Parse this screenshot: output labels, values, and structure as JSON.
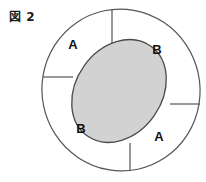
{
  "figure": {
    "caption": "図 2",
    "caption_prefix_glyph": "図",
    "caption_number": "2"
  },
  "colors": {
    "stroke": "#555555",
    "inner_fill": "#d2d2d2",
    "inner_stroke": "#4a4a4a",
    "background": "#ffffff",
    "label_color": "#111111"
  },
  "shapes": {
    "outer_ellipse": {
      "name": "outer-ring-ellipse",
      "cx": 121,
      "cy": 90,
      "rx": 79,
      "ry": 81,
      "rotation": -12,
      "fill": "none"
    },
    "inner_ellipse": {
      "name": "shaded-inner-ellipse",
      "cx": 119,
      "cy": 91,
      "rx": 43,
      "ry": 55,
      "rotation": 35,
      "fill": "#d2d2d2"
    }
  },
  "dividers": [
    {
      "name": "divider-top",
      "x1": 112,
      "y1": 10,
      "x2": 112,
      "y2": 43
    },
    {
      "name": "divider-right",
      "x1": 170,
      "y1": 104,
      "x2": 200,
      "y2": 104
    },
    {
      "name": "divider-bottom",
      "x1": 130,
      "y1": 143,
      "x2": 130,
      "y2": 171
    },
    {
      "name": "divider-left",
      "x1": 43,
      "y1": 77,
      "x2": 73,
      "y2": 77
    }
  ],
  "labels": [
    {
      "name": "region-label-a-top-left",
      "text": "A",
      "x": 73,
      "y": 46
    },
    {
      "name": "region-label-b-top-right",
      "text": "B",
      "x": 157,
      "y": 51
    },
    {
      "name": "region-label-b-bottom-left",
      "text": "B",
      "x": 81,
      "y": 130
    },
    {
      "name": "region-label-a-bottom-right",
      "text": "A",
      "x": 159,
      "y": 138
    }
  ]
}
